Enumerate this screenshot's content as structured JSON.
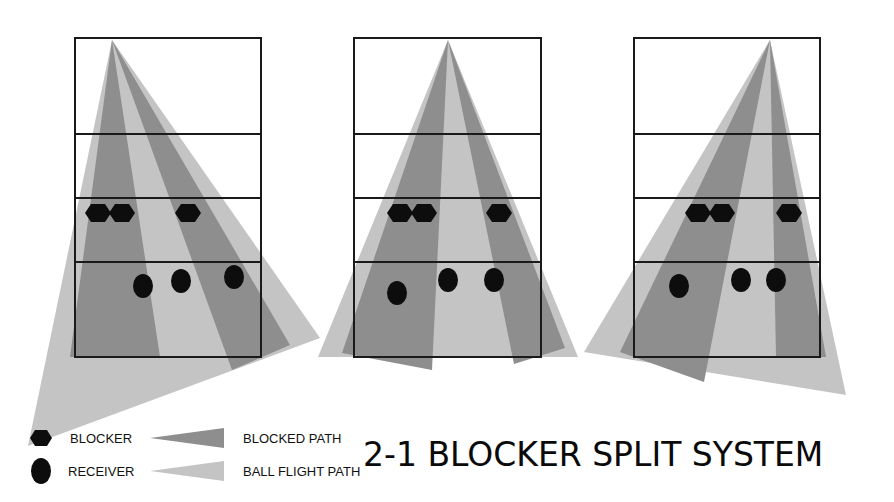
{
  "title": "2-1 BLOCKER SPLIT SYSTEM",
  "colors": {
    "court_line": "#1a1a1a",
    "blocked_path": "#8e8e8e",
    "ball_flight_path": "#c4c4c4",
    "player": "#0d0d0d",
    "background": "#ffffff"
  },
  "legend": {
    "blocker_label": "BLOCKER",
    "receiver_label": "RECEIVER",
    "blocked_path_label": "BLOCKED PATH",
    "ball_flight_path_label": "BALL FLIGHT PATH"
  },
  "courts": [
    {
      "name": "left-attack",
      "box": {
        "x": 75,
        "y": 38,
        "w": 186,
        "h": 319
      },
      "lines_y": [
        134,
        198,
        262
      ],
      "apex": [
        112,
        40
      ],
      "ball_flight_fans": [
        [
          [
            112,
            40
          ],
          [
            28,
            446
          ],
          [
            320,
            338
          ]
        ]
      ],
      "blocked_fans": [
        [
          [
            112,
            40
          ],
          [
            70,
            357
          ],
          [
            160,
            357
          ]
        ],
        [
          [
            112,
            40
          ],
          [
            232,
            370
          ],
          [
            290,
            345
          ]
        ]
      ],
      "blockers": [
        [
          98,
          213
        ],
        [
          122,
          213
        ],
        [
          188,
          213
        ]
      ],
      "receivers": [
        [
          143,
          286
        ],
        [
          181,
          281
        ],
        [
          234,
          277
        ]
      ]
    },
    {
      "name": "middle-attack",
      "box": {
        "x": 354,
        "y": 38,
        "w": 187,
        "h": 319
      },
      "lines_y": [
        134,
        198,
        262
      ],
      "apex": [
        448,
        40
      ],
      "ball_flight_fans": [
        [
          [
            448,
            40
          ],
          [
            318,
            357
          ],
          [
            578,
            357
          ]
        ]
      ],
      "blocked_fans": [
        [
          [
            448,
            40
          ],
          [
            342,
            353
          ],
          [
            432,
            370
          ]
        ],
        [
          [
            448,
            40
          ],
          [
            514,
            364
          ],
          [
            565,
            348
          ]
        ]
      ],
      "blockers": [
        [
          400,
          213
        ],
        [
          424,
          213
        ],
        [
          499,
          213
        ]
      ],
      "receivers": [
        [
          397,
          293
        ],
        [
          448,
          280
        ],
        [
          494,
          280
        ]
      ]
    },
    {
      "name": "right-attack",
      "box": {
        "x": 634,
        "y": 38,
        "w": 186,
        "h": 319
      },
      "lines_y": [
        134,
        198,
        262
      ],
      "apex": [
        770,
        40
      ],
      "ball_flight_fans": [
        [
          [
            770,
            40
          ],
          [
            584,
            352
          ],
          [
            846,
            395
          ]
        ]
      ],
      "blocked_fans": [
        [
          [
            770,
            40
          ],
          [
            620,
            352
          ],
          [
            704,
            382
          ]
        ],
        [
          [
            770,
            40
          ],
          [
            776,
            357
          ],
          [
            826,
            357
          ]
        ]
      ],
      "blockers": [
        [
          698,
          213
        ],
        [
          722,
          213
        ],
        [
          789,
          213
        ]
      ],
      "receivers": [
        [
          679,
          286
        ],
        [
          741,
          280
        ],
        [
          776,
          280
        ]
      ]
    }
  ]
}
